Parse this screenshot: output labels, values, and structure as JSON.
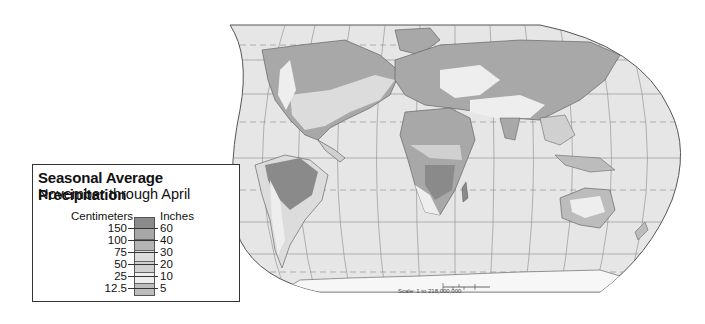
{
  "map": {
    "projection": "Robinson world map",
    "ocean_color": "#e6e6e6",
    "graticule_color": "#7a7a7a",
    "border_color": "#555555"
  },
  "legend": {
    "title": "Seasonal Average Precipitation",
    "subtitle": "November through April",
    "units_left": "Centimeters",
    "units_right": "Inches",
    "classes": [
      {
        "color": "#8a8a8a"
      },
      {
        "color": "#a8a8a8"
      },
      {
        "color": "#b4b4b4"
      },
      {
        "color": "#dcdcdc"
      },
      {
        "color": "#d0d0d0"
      },
      {
        "color": "#eeeeee"
      },
      {
        "color": "#bcbcbc"
      }
    ],
    "ticks_cm": [
      "150",
      "100",
      "75",
      "50",
      "25",
      "12.5"
    ],
    "ticks_in": [
      "60",
      "40",
      "30",
      "20",
      "10",
      "5"
    ]
  },
  "scale": {
    "text": "Scale: 1 to 218,000,000",
    "miles_labels": [
      "0",
      "1000",
      "2000 Miles"
    ],
    "km_labels": [
      "0",
      "1000",
      "2000",
      "3000 Kilometers"
    ]
  }
}
